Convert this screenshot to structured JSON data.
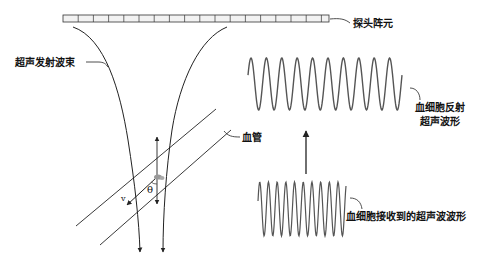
{
  "labels": {
    "transducer": "探头阵元",
    "beam": "超声发射波束",
    "vessel": "血管",
    "reflected_line1": "血细胞反射",
    "reflected_line2": "超声波形",
    "received": "血细胞接收到的超声波波形",
    "velocity": "v",
    "angle": "θ"
  },
  "transducer": {
    "x": 63,
    "y": 15,
    "width": 266,
    "height": 7,
    "cells": 18
  },
  "waves": {
    "reflected": {
      "x0": 248,
      "x1": 402,
      "ymid": 84,
      "amp": 26,
      "period": 15.4
    },
    "received": {
      "x0": 258,
      "x1": 346,
      "ymid": 209,
      "amp": 27,
      "period": 8.7
    }
  },
  "colors": {
    "line": "#222222",
    "wave": "#555555",
    "cell_fill": "#f2f2f2"
  }
}
